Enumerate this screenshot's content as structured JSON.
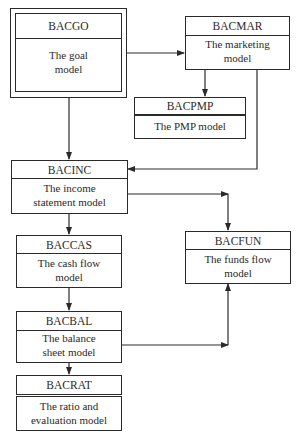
{
  "diagram": {
    "nodes": {
      "bacgo": {
        "code": "BACGO",
        "label": "The goal\nmodel"
      },
      "bacmar": {
        "code": "BACMAR",
        "label": "The marketing\nmodel"
      },
      "bacpmp": {
        "code": "BACPMP",
        "label": "The PMP model"
      },
      "bacinc": {
        "code": "BACINC",
        "label": "The income\nstatement model"
      },
      "baccas": {
        "code": "BACCAS",
        "label": "The cash flow\nmodel"
      },
      "bacfun": {
        "code": "BACFUN",
        "label": "The funds flow\nmodel"
      },
      "bacbal": {
        "code": "BACBAL",
        "label": "The balance\nsheet model"
      },
      "bacrat": {
        "code": "BACRAT",
        "label": "The ratio and\nevaluation model"
      }
    },
    "edges": [
      {
        "from": "BACGO",
        "to": "BACMAR"
      },
      {
        "from": "BACGO",
        "to": "BACINC"
      },
      {
        "from": "BACMAR",
        "to": "BACPMP"
      },
      {
        "from": "BACMAR",
        "to": "BACINC"
      },
      {
        "from": "BACINC",
        "to": "BACCAS"
      },
      {
        "from": "BACINC",
        "to": "BACFUN"
      },
      {
        "from": "BACCAS",
        "to": "BACBAL"
      },
      {
        "from": "BACBAL",
        "to": "BACFUN"
      },
      {
        "from": "BACBAL",
        "to": "BACRAT"
      }
    ],
    "colors": {
      "line": "#2a2a2a",
      "background": "#ffffff"
    }
  }
}
